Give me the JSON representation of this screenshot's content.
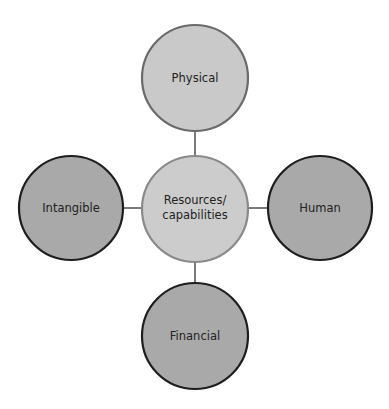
{
  "diagram": {
    "type": "hub-and-spoke",
    "center": {
      "lines": [
        "Resources/",
        "capabilities"
      ],
      "fill": "#cccccc",
      "stroke": "#8a8a8a"
    },
    "nodes": [
      {
        "id": "physical",
        "label": "Physical",
        "position": "top",
        "fill": "#c9c9c9",
        "stroke": "#6a6a6a"
      },
      {
        "id": "intangible",
        "label": "Intangible",
        "position": "left",
        "fill": "#a9a9a9",
        "stroke": "#1e1e1e"
      },
      {
        "id": "human",
        "label": "Human",
        "position": "right",
        "fill": "#a9a9a9",
        "stroke": "#1e1e1e"
      },
      {
        "id": "financial",
        "label": "Financial",
        "position": "bottom",
        "fill": "#a9a9a9",
        "stroke": "#1e1e1e"
      }
    ],
    "connector_color": "#333333"
  }
}
